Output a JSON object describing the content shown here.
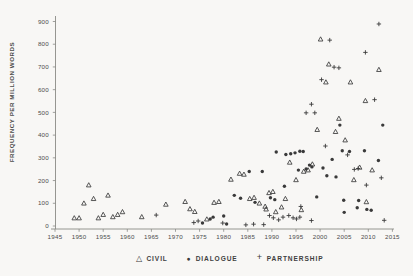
{
  "chart_data": {
    "type": "scatter",
    "title": "",
    "xlabel": "",
    "ylabel": "FREQUENCY PER MILLION WORDS",
    "xlim": [
      1945,
      2015
    ],
    "ylim": [
      0,
      900
    ],
    "xticks": [
      1945,
      1950,
      1955,
      1960,
      1965,
      1970,
      1975,
      1980,
      1985,
      1990,
      1995,
      2000,
      2005,
      2010,
      2015
    ],
    "yticks": [
      0,
      100,
      200,
      300,
      400,
      500,
      600,
      700,
      800,
      900
    ],
    "grid": false,
    "legend_position": "bottom-center",
    "marker_color": "#3a3a3a",
    "axis_color": "#8a8a86",
    "text_color": "#4c4c4c",
    "series": [
      {
        "name": "CIVIL",
        "marker": "triangle",
        "points": [
          [
            1949,
            35
          ],
          [
            1950,
            35
          ],
          [
            1951,
            100
          ],
          [
            1952,
            180
          ],
          [
            1953,
            120
          ],
          [
            1954,
            35
          ],
          [
            1955,
            50
          ],
          [
            1956,
            135
          ],
          [
            1957,
            40
          ],
          [
            1958,
            50
          ],
          [
            1959,
            62
          ],
          [
            1963,
            40
          ],
          [
            1968,
            95
          ],
          [
            1972,
            107
          ],
          [
            1973,
            75
          ],
          [
            1974,
            63
          ],
          [
            1976.5,
            30
          ],
          [
            1978,
            103
          ],
          [
            1979,
            107
          ],
          [
            1981.5,
            205
          ],
          [
            1983.3,
            231
          ],
          [
            1984.2,
            227
          ],
          [
            1985.4,
            120
          ],
          [
            1986.3,
            125
          ],
          [
            1987.4,
            100
          ],
          [
            1988.6,
            86
          ],
          [
            1988.8,
            74
          ],
          [
            1989.4,
            146
          ],
          [
            1990.2,
            151
          ],
          [
            1990.8,
            62
          ],
          [
            1992,
            83
          ],
          [
            1992.8,
            120
          ],
          [
            1993.7,
            280
          ],
          [
            1995,
            203
          ],
          [
            1996.1,
            71
          ],
          [
            1996.6,
            240
          ],
          [
            1997.5,
            246
          ],
          [
            1998.4,
            272
          ],
          [
            1999.4,
            424
          ],
          [
            2000.1,
            822
          ],
          [
            2001.2,
            633
          ],
          [
            2001.8,
            712
          ],
          [
            2003.2,
            415
          ],
          [
            2003.9,
            473
          ],
          [
            2005.2,
            378
          ],
          [
            2006.3,
            633
          ],
          [
            2007,
            203
          ],
          [
            2008.2,
            258
          ],
          [
            2009.4,
            551
          ],
          [
            2009.6,
            106
          ],
          [
            2010.8,
            246
          ],
          [
            2012.2,
            688
          ]
        ]
      },
      {
        "name": "DIALOGUE",
        "marker": "circle",
        "points": [
          [
            1975.6,
            13
          ],
          [
            1977.2,
            31
          ],
          [
            1977.8,
            39
          ],
          [
            1980,
            44
          ],
          [
            1980.6,
            9
          ],
          [
            1982.2,
            135
          ],
          [
            1983.5,
            122
          ],
          [
            1985.3,
            240
          ],
          [
            1986.5,
            104
          ],
          [
            1988,
            240
          ],
          [
            1989.7,
            124
          ],
          [
            1990.6,
            116
          ],
          [
            1992.6,
            175
          ],
          [
            1990.9,
            326
          ],
          [
            1992.9,
            315
          ],
          [
            1993.9,
            318
          ],
          [
            1994.8,
            322
          ],
          [
            1995.8,
            329
          ],
          [
            1996.5,
            328
          ],
          [
            1995.5,
            246
          ],
          [
            1997.1,
            251
          ],
          [
            1997.8,
            268
          ],
          [
            1998.3,
            260
          ],
          [
            1999.3,
            128
          ],
          [
            2000.6,
            255
          ],
          [
            2001.4,
            221
          ],
          [
            2002.5,
            293
          ],
          [
            2003.3,
            216
          ],
          [
            2004.1,
            444
          ],
          [
            2004.6,
            331
          ],
          [
            2004.9,
            113
          ],
          [
            2005,
            60
          ],
          [
            2006.1,
            328
          ],
          [
            2007.7,
            80
          ],
          [
            2008,
            112
          ],
          [
            2009.2,
            331
          ],
          [
            2009.7,
            73
          ],
          [
            2010.6,
            69
          ],
          [
            2012.1,
            288
          ],
          [
            2013,
            444
          ]
        ]
      },
      {
        "name": "PARTNERSHIP",
        "marker": "plus",
        "points": [
          [
            1966,
            48
          ],
          [
            1973.8,
            15
          ],
          [
            1974.7,
            22
          ],
          [
            1979.8,
            13
          ],
          [
            1984.6,
            5
          ],
          [
            1986.2,
            8
          ],
          [
            1988.3,
            6
          ],
          [
            1989.5,
            46
          ],
          [
            1990.3,
            36
          ],
          [
            1991.4,
            27
          ],
          [
            1992.3,
            39
          ],
          [
            1993.5,
            46
          ],
          [
            1994.4,
            36
          ],
          [
            1995.1,
            31
          ],
          [
            1995.8,
            39
          ],
          [
            1996,
            86
          ],
          [
            1998.2,
            24
          ],
          [
            1997.1,
            498
          ],
          [
            1998.2,
            536
          ],
          [
            1998.9,
            498
          ],
          [
            2000.3,
            644
          ],
          [
            2001.1,
            352
          ],
          [
            2002,
            818
          ],
          [
            2002.9,
            699
          ],
          [
            2003.9,
            696
          ],
          [
            2005.7,
            313
          ],
          [
            2007.1,
            249
          ],
          [
            2007.9,
            253
          ],
          [
            2009.4,
            764
          ],
          [
            2009.6,
            180
          ],
          [
            2011.3,
            556
          ],
          [
            2012.2,
            889
          ],
          [
            2012.7,
            212
          ],
          [
            2013.3,
            25
          ]
        ]
      }
    ]
  }
}
